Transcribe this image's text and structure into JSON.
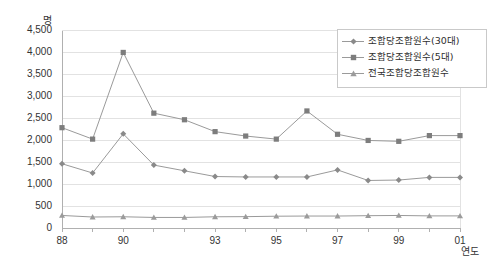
{
  "chart_data": {
    "type": "line",
    "title": "",
    "xlabel": "연도",
    "ylabel": "명",
    "ylim": [
      0,
      4500
    ],
    "ytick_step": 500,
    "grid": true,
    "legend_position": "top-right",
    "x": [
      1988,
      1989,
      1990,
      1991,
      1992,
      1993,
      1994,
      1995,
      1996,
      1997,
      1998,
      1999,
      2000,
      2001
    ],
    "categories": [
      "88",
      "89",
      "90",
      "91",
      "92",
      "93",
      "94",
      "95",
      "96",
      "97",
      "98",
      "99",
      "00",
      "01"
    ],
    "xtick_labels_shown": [
      "88",
      "90",
      "93",
      "95",
      "97",
      "99",
      "01"
    ],
    "ytick_labels": [
      "0",
      "500",
      "1,000",
      "1,500",
      "2,000",
      "2,500",
      "3,000",
      "3,500",
      "4,000",
      "4,500"
    ],
    "series": [
      {
        "name": "조합당조합원수(30대)",
        "marker": "diamond",
        "color": "#8a8a8a",
        "values": [
          1460,
          1250,
          2140,
          1430,
          1300,
          1170,
          1160,
          1160,
          1160,
          1320,
          1080,
          1090,
          1150,
          1150
        ]
      },
      {
        "name": "조합당조합원수(5대)",
        "marker": "square",
        "color": "#7d7d7d",
        "values": [
          2280,
          2020,
          3990,
          2610,
          2460,
          2190,
          2090,
          2020,
          2660,
          2130,
          1990,
          1970,
          2100,
          2100
        ]
      },
      {
        "name": "전국조합당조합원수",
        "marker": "triangle",
        "color": "#9b9b9b",
        "values": [
          285,
          250,
          255,
          240,
          240,
          255,
          258,
          268,
          272,
          272,
          280,
          285,
          275,
          275
        ]
      }
    ]
  },
  "axis": {
    "y_unit_label": "명",
    "x_unit_label": "연도"
  },
  "legend": {
    "items": [
      {
        "label": "조합당조합원수(30대)",
        "marker": "diamond-marker"
      },
      {
        "label": "조합당조합원수(5대)",
        "marker": "square-marker"
      },
      {
        "label": "전국조합당조합원수",
        "marker": "triangle-marker"
      }
    ]
  },
  "style": {
    "line_color": "#9a9a9a",
    "grid_color": "#e2e2e2",
    "axis_color": "#b0b0b0",
    "text_color": "#333333",
    "background": "#ffffff"
  }
}
